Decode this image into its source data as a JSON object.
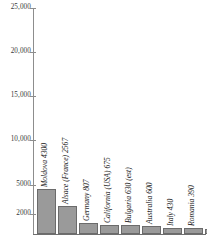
{
  "chart_data": {
    "type": "bar",
    "title": "",
    "subtitle": "",
    "xlabel": "",
    "ylabel": "",
    "grid": false,
    "legend": "none",
    "orientation": "vertical",
    "bar_color": "#9a9a9a",
    "bar_outline_color": "#6b6b6b",
    "axis_color": "#8d8d8d",
    "ylim": [
      0,
      25000
    ],
    "ytick_labels": [
      "25,000",
      "20,000",
      "15,000",
      "10,000",
      "5000",
      "2000"
    ],
    "ytick_values": [
      25000,
      20000,
      15000,
      10000,
      5000,
      2000
    ],
    "ytick_pixel_y": [
      8,
      52,
      96,
      140,
      185,
      214
    ],
    "categories": [
      "Moldova",
      "Alsace (France)",
      "Germany",
      "California (USA)",
      "Bulgaria",
      "Australia",
      "Italy",
      "Romania",
      "Austria",
      "South Africa"
    ],
    "values": [
      4300,
      2567,
      807,
      675,
      630,
      600,
      430,
      390,
      363,
      325
    ],
    "point_labels": [
      "Moldova 4300",
      "Alsace (France) 2567",
      "Germany 807",
      "California (USA) 675",
      "Bulgaria 630 (est)",
      "Australia 600",
      "Italy 430",
      "Romania 390",
      "Austria 363",
      "South Africa 325"
    ],
    "bars": [
      {
        "label": "Moldova 4300",
        "value": 4300,
        "left": 3,
        "width": 19,
        "height": 45
      },
      {
        "label": "Alsace (France) 2567",
        "value": 2567,
        "left": 24,
        "width": 19,
        "height": 28
      },
      {
        "label": "Germany 807",
        "value": 807,
        "left": 45,
        "width": 19,
        "height": 11
      },
      {
        "label": "California (USA) 675",
        "value": 675,
        "left": 66,
        "width": 19,
        "height": 9
      },
      {
        "label": "Bulgaria 630 (est)",
        "value": 630,
        "left": 87,
        "width": 19,
        "height": 9
      },
      {
        "label": "Australia 600",
        "value": 600,
        "left": 108,
        "width": 19,
        "height": 8
      },
      {
        "label": "Italy 430",
        "value": 430,
        "left": 129,
        "width": 19,
        "height": 6
      },
      {
        "label": "Romania 390",
        "value": 390,
        "left": 150,
        "width": 19,
        "height": 6
      },
      {
        "label": "Austria 363",
        "value": 363,
        "left": 171,
        "width": 19,
        "height": 5
      },
      {
        "label": "South Africa 325",
        "value": 325,
        "left": 192,
        "width": 19,
        "height": 5
      }
    ]
  }
}
